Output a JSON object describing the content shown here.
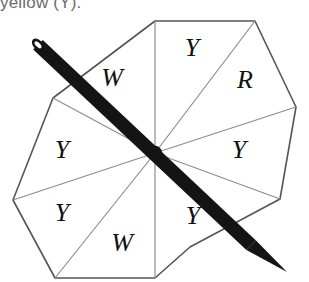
{
  "caption": {
    "text": "yellow (Y)."
  },
  "spinner": {
    "name": "octagon-spinner",
    "shape": "octagon",
    "sector_count": 8,
    "center": {
      "x": 155,
      "y": 153
    },
    "outline_color": "#555555",
    "divider_color": "#8d8d8d",
    "fill_color": "#ffffff",
    "pointer_color": "#111111",
    "label_color": "#111111",
    "vertices": [
      {
        "x": 155,
        "y": 21
      },
      {
        "x": 255,
        "y": 21
      },
      {
        "x": 296,
        "y": 107
      },
      {
        "x": 280,
        "y": 199
      },
      {
        "x": 190,
        "y": 247
      },
      {
        "x": 155,
        "y": 278
      },
      {
        "x": 55,
        "y": 278
      },
      {
        "x": 13,
        "y": 200
      },
      {
        "x": 53,
        "y": 98
      }
    ],
    "sectors": [
      {
        "id": "sector-top-right",
        "label": "Y",
        "label_x": 192,
        "label_y": 50
      },
      {
        "id": "sector-right-upper",
        "label": "R",
        "label_x": 245,
        "label_y": 82
      },
      {
        "id": "sector-right-lower",
        "label": "Y",
        "label_x": 239,
        "label_y": 152
      },
      {
        "id": "sector-bottom-right",
        "label": "Y",
        "label_x": 193,
        "label_y": 218
      },
      {
        "id": "sector-bottom-left",
        "label": "W",
        "label_x": 122,
        "label_y": 245
      },
      {
        "id": "sector-left-lower",
        "label": "Y",
        "label_x": 62,
        "label_y": 215
      },
      {
        "id": "sector-left-upper",
        "label": "Y",
        "label_x": 62,
        "label_y": 152
      },
      {
        "id": "sector-top-left",
        "label": "W",
        "label_x": 112,
        "label_y": 80
      }
    ],
    "pointer": {
      "name": "spinner-pointer",
      "tail_x": 38,
      "tail_y": 45,
      "tip_x": 287,
      "tip_y": 272,
      "width": 13
    }
  }
}
